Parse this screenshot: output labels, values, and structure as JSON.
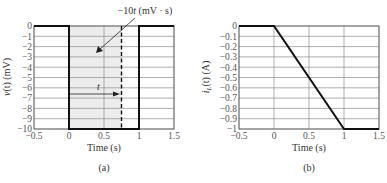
{
  "chart_data": [
    {
      "id": "a",
      "type": "line",
      "caption": "(a)",
      "title": "",
      "xlabel": "Time (s)",
      "ylabel": "v(t) (mV)",
      "xlim": [
        -0.5,
        1.5
      ],
      "ylim": [
        -10,
        0
      ],
      "xticks": [
        -0.5,
        0,
        0.5,
        1,
        1.5
      ],
      "xtick_labels": [
        "−0.5",
        "0",
        "0.5",
        "1",
        "1.5"
      ],
      "yticks": [
        0,
        -1,
        -2,
        -3,
        -4,
        -5,
        -6,
        -7,
        -8,
        -9,
        -10
      ],
      "ytick_labels": [
        "0",
        "−1",
        "−2",
        "−3",
        "−4",
        "−5",
        "−6",
        "−7",
        "−8",
        "−9",
        "−10"
      ],
      "grid": true,
      "series": [
        {
          "name": "v(t)",
          "x": [
            -0.5,
            0,
            0,
            1,
            1,
            1.5
          ],
          "y": [
            0,
            0,
            -10,
            -10,
            0,
            0
          ]
        }
      ],
      "shaded_region": {
        "x_from": 0,
        "x_to": 0.75,
        "color": "#ececec"
      },
      "dashed_line_x": 0.75,
      "annotations": [
        {
          "text": "−10t (mV · s)",
          "arrow_to": [
            0.4,
            -2.5
          ]
        },
        {
          "text": "t",
          "arrow_from_x": 0,
          "arrow_to_x": 0.75,
          "y": -6.5
        }
      ]
    },
    {
      "id": "b",
      "type": "line",
      "caption": "(b)",
      "title": "",
      "xlabel": "Time (s)",
      "ylabel": "iL(t) (A)",
      "xlim": [
        -0.5,
        1.5
      ],
      "ylim": [
        -1,
        0
      ],
      "xticks": [
        -0.5,
        0,
        0.5,
        1,
        1.5
      ],
      "xtick_labels": [
        "−0.5",
        "0",
        "0.5",
        "1",
        "1.5"
      ],
      "yticks": [
        0,
        -0.1,
        -0.2,
        -0.3,
        -0.4,
        -0.5,
        -0.6,
        -0.7,
        -0.8,
        -0.9,
        -1
      ],
      "ytick_labels": [
        "0",
        "−0.1",
        "−0.2",
        "−0.3",
        "−0.4",
        "−0.5",
        "−0.6",
        "−0.7",
        "−0.8",
        "−0.9",
        "−1"
      ],
      "grid": true,
      "series": [
        {
          "name": "iL(t)",
          "x": [
            -0.5,
            0,
            1,
            1.5
          ],
          "y": [
            0,
            0,
            -1,
            -1
          ]
        }
      ]
    }
  ],
  "labels": {
    "a": {
      "ylabel_main": "v",
      "ylabel_rest": "(t) (mV)",
      "ylabel_var": "t",
      "xlabel": "Time (s)",
      "caption": "(a)",
      "annot_prefix": "−10",
      "annot_var": "t",
      "annot_suffix": " (mV · s)",
      "t_label": "t"
    },
    "b": {
      "ylabel_main": "i",
      "ylabel_sub": "L",
      "ylabel_rest": "(t) (A)",
      "xlabel": "Time (s)",
      "caption": "(b)"
    }
  },
  "colors": {
    "waveform": "#111111",
    "grid": "#8c8c8c",
    "frame": "#666666",
    "shade": "#ececec"
  }
}
